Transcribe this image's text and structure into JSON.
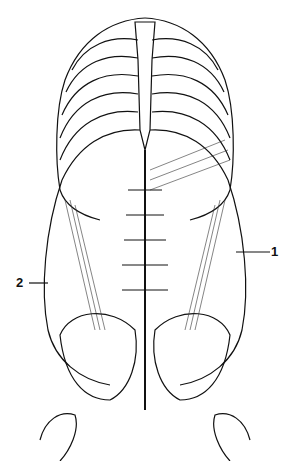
{
  "figure": {
    "labels": [
      {
        "id": "1",
        "text": "1",
        "side": "right"
      },
      {
        "id": "2",
        "text": "2",
        "side": "left"
      }
    ],
    "colors": {
      "ink": "#111111",
      "background": "#ffffff"
    }
  }
}
